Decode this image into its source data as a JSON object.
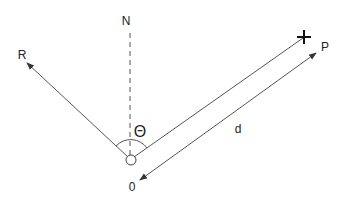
{
  "diagram": {
    "type": "vector-geometry",
    "labels": {
      "north": "N",
      "reference": "R",
      "point": "P",
      "angle": "Θ",
      "distance": "d",
      "origin": "0"
    },
    "marker_symbol": "+",
    "colors": {
      "line": "#555555",
      "text": "#222222",
      "background": "#ffffff"
    }
  }
}
